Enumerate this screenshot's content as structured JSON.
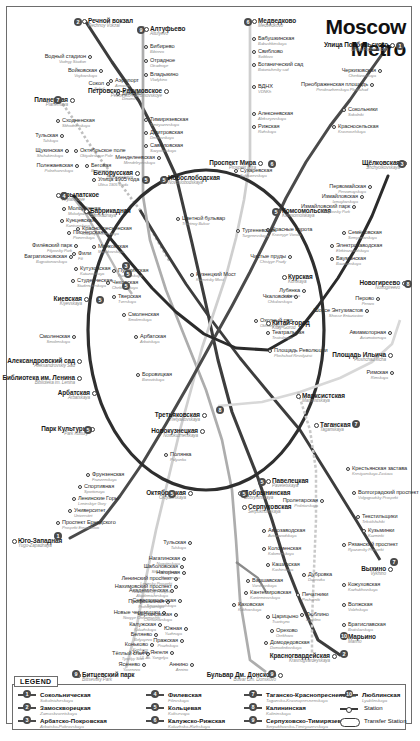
{
  "title": {
    "line1": "Moscow",
    "line2": "Metro"
  },
  "legend": {
    "heading": "LEGEND",
    "lines": [
      {
        "id": 1,
        "ru": "Сокольническая",
        "en": "Sokolnicheskaya",
        "color": "#d0021b",
        "col": 0
      },
      {
        "id": 2,
        "ru": "Замоскворецкая",
        "en": "Zamoskvoretskaya",
        "color": "#2b8a3e",
        "col": 0
      },
      {
        "id": 3,
        "ru": "Арбатско-Покровская",
        "en": "Arbatsko-Pokrovskaya",
        "color": "#1f4fa0",
        "col": 0
      },
      {
        "id": 4,
        "ru": "Филевская",
        "en": "Filevskaya",
        "color": "#4aa8dd",
        "col": 1
      },
      {
        "id": 5,
        "ru": "Кольцевая",
        "en": "Koltsevaya",
        "color": "#8a4b2a",
        "col": 1
      },
      {
        "id": 6,
        "ru": "Калужско-Рижская",
        "en": "Kaluzhsko-Rizhskaya",
        "color": "#f39200",
        "col": 1
      },
      {
        "id": 7,
        "ru": "Таганско-Краснопресненская",
        "en": "Tagansko-Krasnopresnenskaya",
        "color": "#7d3f98",
        "col": 2
      },
      {
        "id": 8,
        "ru": "Калининская",
        "en": "Kalininskaya",
        "color": "#f7d117",
        "col": 2
      },
      {
        "id": 9,
        "ru": "Серпуховско-Тимирязевская",
        "en": "Serpukhovsko-Timiryazevskaya",
        "color": "#9e9e9e",
        "col": 2
      },
      {
        "id": 10,
        "ru": "Люблинская",
        "en": "Lyublinskaya",
        "color": "#b7d44b",
        "col": 3
      }
    ],
    "symbols": [
      {
        "key": "station",
        "label": "Station"
      },
      {
        "key": "transfer",
        "label": "Transfer Station"
      }
    ]
  },
  "stations": [
    {
      "ru": "Речной вокзал",
      "en": "Rechnoy Vokzal",
      "x": 88,
      "y": 18,
      "a": "l",
      "big": true
    },
    {
      "ru": "Водный стадион",
      "en": "Vodnyy Stadion",
      "x": 86,
      "y": 54,
      "a": "r"
    },
    {
      "ru": "Войковская",
      "en": "Voykovskaya",
      "x": 97,
      "y": 68,
      "a": "r"
    },
    {
      "ru": "Сокол",
      "en": "Sokol",
      "x": 104,
      "y": 81,
      "a": "r"
    },
    {
      "ru": "Аэропорт",
      "en": "Aeroport",
      "x": 115,
      "y": 78,
      "a": "l"
    },
    {
      "ru": "Динамо",
      "en": "Dinamo",
      "x": 122,
      "y": 91,
      "a": "l"
    },
    {
      "ru": "Белорусская",
      "en": "Belorusskaya",
      "x": 133,
      "y": 170,
      "a": "r",
      "big": true
    },
    {
      "ru": "Планерная",
      "en": "Planernaya",
      "x": 68,
      "y": 97,
      "a": "r",
      "big": true
    },
    {
      "ru": "Сходненская",
      "en": "Skhodnenskaya",
      "x": 62,
      "y": 118,
      "a": "l"
    },
    {
      "ru": "Тульская",
      "en": "Tulskaya",
      "x": 58,
      "y": 133,
      "a": "r"
    },
    {
      "ru": "Щукинская",
      "en": "Shchukinskaya",
      "x": 63,
      "y": 148,
      "a": "r"
    },
    {
      "ru": "Полежаевская",
      "en": "Polezhaevskaya",
      "x": 73,
      "y": 163,
      "a": "r"
    },
    {
      "ru": "Октябрьское поле",
      "en": "Oktyabrskoye Pole",
      "x": 80,
      "y": 148,
      "a": "l"
    },
    {
      "ru": "Беговая",
      "en": "Begovaya",
      "x": 91,
      "y": 163,
      "a": "l"
    },
    {
      "ru": "Улица 1905 года",
      "en": "Ulitsa 1905 Goda",
      "x": 98,
      "y": 177,
      "a": "l"
    },
    {
      "ru": "Крылатское",
      "en": "Krylatskoye",
      "x": 62,
      "y": 192,
      "a": "l",
      "big": true
    },
    {
      "ru": "Молодёжная",
      "en": "Molodyozhnaya",
      "x": 68,
      "y": 206,
      "a": "l"
    },
    {
      "ru": "Кунцевская",
      "en": "Kuntsevskaya",
      "x": 66,
      "y": 218,
      "a": "l"
    },
    {
      "ru": "Пионерская",
      "en": "Pionerskaya",
      "x": 73,
      "y": 230,
      "a": "l"
    },
    {
      "ru": "Филёвский парк",
      "en": "Filyovsky Park",
      "x": 72,
      "y": 243,
      "a": "r"
    },
    {
      "ru": "Багратионовская",
      "en": "Bagrationovskaya",
      "x": 67,
      "y": 254,
      "a": "r"
    },
    {
      "ru": "Фили",
      "en": "Fili",
      "x": 78,
      "y": 251,
      "a": "l"
    },
    {
      "ru": "Кутузовская",
      "en": "Kutuzovskaya",
      "x": 80,
      "y": 266,
      "a": "l"
    },
    {
      "ru": "Студенческая",
      "en": "Studencheskaya",
      "x": 77,
      "y": 278,
      "a": "l"
    },
    {
      "ru": "Киевская",
      "en": "Kiyevskaya",
      "x": 82,
      "y": 296,
      "a": "r",
      "big": true
    },
    {
      "ru": "Смоленская",
      "en": "Smolenskaya",
      "x": 70,
      "y": 334,
      "a": "r"
    },
    {
      "ru": "Александровский сад",
      "en": "Aleksandrovskiy Sad",
      "x": 75,
      "y": 358,
      "a": "r",
      "big": true
    },
    {
      "ru": "Библиотека им. Ленина",
      "en": "Biblioteka im. Lenina",
      "x": 75,
      "y": 375,
      "a": "r",
      "big": true
    },
    {
      "ru": "Арбатская",
      "en": "Arbatskaya",
      "x": 90,
      "y": 390,
      "a": "r",
      "big": true
    },
    {
      "ru": "Парк Культуры",
      "en": "Park Kultury",
      "x": 88,
      "y": 426,
      "a": "r",
      "big": true
    },
    {
      "ru": "Алтуфьево",
      "en": "Altufyevo",
      "x": 150,
      "y": 26,
      "a": "l",
      "big": true
    },
    {
      "ru": "Бибирево",
      "en": "Bibirevo",
      "x": 150,
      "y": 44,
      "a": "l"
    },
    {
      "ru": "Отрадное",
      "en": "Otradnoye",
      "x": 150,
      "y": 58,
      "a": "l"
    },
    {
      "ru": "Владыкино",
      "en": "Vladykino",
      "x": 150,
      "y": 72,
      "a": "l"
    },
    {
      "ru": "Петровско-Разумовское",
      "en": "Petrovsko-Razumovskoye",
      "x": 162,
      "y": 88,
      "a": "r",
      "big": true
    },
    {
      "ru": "Тимирязевская",
      "en": "Timiryazevskaya",
      "x": 150,
      "y": 117,
      "a": "l"
    },
    {
      "ru": "Дмитровская",
      "en": "Dmitrovskaya",
      "x": 150,
      "y": 130,
      "a": "l"
    },
    {
      "ru": "Савёловская",
      "en": "Savyolovskaya",
      "x": 150,
      "y": 143,
      "a": "l"
    },
    {
      "ru": "Менделеевская",
      "en": "Mendeleyevskaya",
      "x": 155,
      "y": 155,
      "a": "r"
    },
    {
      "ru": "Новослободская",
      "en": "Novoslobodskaya",
      "x": 168,
      "y": 175,
      "a": "l",
      "big": true
    },
    {
      "ru": "Медведково",
      "en": "Medvedkovo",
      "x": 258,
      "y": 18,
      "a": "l",
      "big": true
    },
    {
      "ru": "Бабушкинская",
      "en": "Babushkinskaya",
      "x": 258,
      "y": 36,
      "a": "l"
    },
    {
      "ru": "Свиблово",
      "en": "Sviblovo",
      "x": 258,
      "y": 49,
      "a": "l"
    },
    {
      "ru": "Ботанический сад",
      "en": "Botanichesky sad",
      "x": 258,
      "y": 62,
      "a": "l"
    },
    {
      "ru": "ВДНХ",
      "en": "VDNKh",
      "x": 258,
      "y": 84,
      "a": "l"
    },
    {
      "ru": "Алексеевская",
      "en": "Alekseyevskaya",
      "x": 258,
      "y": 111,
      "a": "l"
    },
    {
      "ru": "Рижская",
      "en": "Rizhskaya",
      "x": 258,
      "y": 124,
      "a": "l"
    },
    {
      "ru": "Проспект Мира",
      "en": "Prospekt Mira",
      "x": 256,
      "y": 160,
      "a": "r",
      "big": true
    },
    {
      "ru": "Улица Подбельского",
      "en": "Ulitsa Podbelskovo",
      "x": 388,
      "y": 42,
      "a": "r",
      "big": true
    },
    {
      "ru": "Черкизовская",
      "en": "Cherkizovskaya",
      "x": 376,
      "y": 68,
      "a": "r"
    },
    {
      "ru": "Преображенская площадь",
      "en": "Preobrazhenskaya Ploshchad",
      "x": 368,
      "y": 82,
      "a": "r"
    },
    {
      "ru": "Сокольники",
      "en": "Sokolniki",
      "x": 348,
      "y": 107,
      "a": "l"
    },
    {
      "ru": "Красносельская",
      "en": "Krasnoselskaya",
      "x": 338,
      "y": 124,
      "a": "l"
    },
    {
      "ru": "Комсомольская",
      "en": "Komsomolskaya",
      "x": 282,
      "y": 208,
      "a": "l",
      "big": true
    },
    {
      "ru": "Красные ворота",
      "en": "Krasnyye Vorota",
      "x": 272,
      "y": 227,
      "a": "l"
    },
    {
      "ru": "Чистые пруды",
      "en": "Chistyye Prudy",
      "x": 286,
      "y": 254,
      "a": "r"
    },
    {
      "ru": "Лубянка",
      "en": "Lubyanka",
      "x": 300,
      "y": 288,
      "a": "r"
    },
    {
      "ru": "Охотный ряд",
      "en": "Okhotny Ryad",
      "x": 260,
      "y": 318,
      "a": "l"
    },
    {
      "ru": "Щёлковская",
      "en": "Shchyolkovskaya",
      "x": 400,
      "y": 160,
      "a": "r",
      "big": true
    },
    {
      "ru": "Первомайская",
      "en": "Pervomayskaya",
      "x": 366,
      "y": 184,
      "a": "r"
    },
    {
      "ru": "Измайловская",
      "en": "Izmaylovskaya",
      "x": 358,
      "y": 194,
      "a": "r"
    },
    {
      "ru": "Измайловский парк",
      "en": "Izmaylovsky Park",
      "x": 350,
      "y": 204,
      "a": "r"
    },
    {
      "ru": "Семёновская",
      "en": "Semyonovskaya",
      "x": 348,
      "y": 230,
      "a": "l"
    },
    {
      "ru": "Электрозаводская",
      "en": "Elektrozavodskaya",
      "x": 336,
      "y": 243,
      "a": "l"
    },
    {
      "ru": "Бауманская",
      "en": "Baumanskaya",
      "x": 336,
      "y": 256,
      "a": "l"
    },
    {
      "ru": "Курская",
      "en": "Kurskaya",
      "x": 288,
      "y": 274,
      "a": "l",
      "big": true
    },
    {
      "ru": "Чкаловская",
      "en": "Chkalovskaya",
      "x": 292,
      "y": 294,
      "a": "r"
    },
    {
      "ru": "Китай-город",
      "en": "Kitay-Gorod",
      "x": 272,
      "y": 320,
      "a": "l",
      "big": true
    },
    {
      "ru": "Новогиреево",
      "en": "Novogireevo",
      "x": 400,
      "y": 280,
      "a": "r",
      "big": true
    },
    {
      "ru": "Перово",
      "en": "Perovo",
      "x": 374,
      "y": 296,
      "a": "r"
    },
    {
      "ru": "Шоссе Энтузиастов",
      "en": "Shosse Entuziastov",
      "x": 363,
      "y": 308,
      "a": "r"
    },
    {
      "ru": "Авиамоторная",
      "en": "Aviamotornaya",
      "x": 386,
      "y": 330,
      "a": "r"
    },
    {
      "ru": "Площадь Ильича",
      "en": "Ploshchad Ilicha",
      "x": 386,
      "y": 352,
      "a": "r",
      "big": true
    },
    {
      "ru": "Римская",
      "en": "Rimskaya",
      "x": 388,
      "y": 370,
      "a": "r"
    },
    {
      "ru": "Марксистская",
      "en": "Marksistskaya",
      "x": 302,
      "y": 393,
      "a": "l",
      "big": true
    },
    {
      "ru": "Таганская",
      "en": "Taganskaya",
      "x": 320,
      "y": 422,
      "a": "l",
      "big": true
    },
    {
      "ru": "Сухаревская",
      "en": "Sukharevskaya",
      "x": 240,
      "y": 168,
      "a": "l"
    },
    {
      "ru": "Тургеневская",
      "en": "Turgenevskaya",
      "x": 242,
      "y": 228,
      "a": "l"
    },
    {
      "ru": "Цветной бульвар",
      "en": "Tsvetnoy Bulvar",
      "x": 182,
      "y": 216,
      "a": "l"
    },
    {
      "ru": "Кузнецкий Мост",
      "en": "Kuznetsky Most",
      "x": 196,
      "y": 272,
      "a": "l"
    },
    {
      "ru": "Баррикадная",
      "en": "Barrikadnaya",
      "x": 90,
      "y": 208,
      "a": "l",
      "big": true
    },
    {
      "ru": "Краснопресненская",
      "en": "Krasnopresnenskaya",
      "x": 82,
      "y": 226,
      "a": "l"
    },
    {
      "ru": "Маяковская",
      "en": "Mayakovskaya",
      "x": 98,
      "y": 244,
      "a": "l"
    },
    {
      "ru": "Пушкинская",
      "en": "Pushkinskaya",
      "x": 118,
      "y": 268,
      "a": "l"
    },
    {
      "ru": "Чеховская",
      "en": "Chekhovskaya",
      "x": 112,
      "y": 280,
      "a": "l"
    },
    {
      "ru": "Тверская",
      "en": "Tverskaya",
      "x": 118,
      "y": 294,
      "a": "l"
    },
    {
      "ru": "Смоленская",
      "en": "Smolenskaya",
      "x": 128,
      "y": 312,
      "a": "l"
    },
    {
      "ru": "Арбатская",
      "en": "Arbatskaya",
      "x": 140,
      "y": 334,
      "a": "l"
    },
    {
      "ru": "Боровицкая",
      "en": "Borovitskaya",
      "x": 142,
      "y": 372,
      "a": "l"
    },
    {
      "ru": "Театральная",
      "en": "Teatralnaya",
      "x": 272,
      "y": 330,
      "a": "l"
    },
    {
      "ru": "Площадь Революции",
      "en": "Ploshchad Revolyutsii",
      "x": 274,
      "y": 348,
      "a": "l"
    },
    {
      "ru": "Третьяковская",
      "en": "Tretyakovskaya",
      "x": 200,
      "y": 412,
      "a": "r",
      "big": true
    },
    {
      "ru": "Новокузнецкая",
      "en": "Novokuznetskaya",
      "x": 198,
      "y": 428,
      "a": "r",
      "big": true
    },
    {
      "ru": "Полянка",
      "en": "Polyanka",
      "x": 170,
      "y": 452,
      "a": "l"
    },
    {
      "ru": "Октябрьская",
      "en": "Oktyabrskaya",
      "x": 186,
      "y": 490,
      "a": "r",
      "big": true
    },
    {
      "ru": "Добрынинская",
      "en": "Dobryninskaya",
      "x": 244,
      "y": 490,
      "a": "l",
      "big": true
    },
    {
      "ru": "Серпуховская",
      "en": "Serpukhovskaya",
      "x": 248,
      "y": 504,
      "a": "l",
      "big": true
    },
    {
      "ru": "Павелецкая",
      "en": "Paveletskaya",
      "x": 272,
      "y": 478,
      "a": "l",
      "big": true
    },
    {
      "ru": "Пролетарская",
      "en": "Proletarskaya",
      "x": 318,
      "y": 498,
      "a": "r"
    },
    {
      "ru": "Автозаводская",
      "en": "Avtozavodskaya",
      "x": 268,
      "y": 528,
      "a": "l"
    },
    {
      "ru": "Коломенская",
      "en": "Kolomenskaya",
      "x": 268,
      "y": 546,
      "a": "l"
    },
    {
      "ru": "Каширская",
      "en": "Kashirskaya",
      "x": 272,
      "y": 562,
      "a": "l"
    },
    {
      "ru": "Варшавская",
      "en": "Varshavskaya",
      "x": 252,
      "y": 578,
      "a": "l"
    },
    {
      "ru": "Кантемировская",
      "en": "Kantemirovskaya",
      "x": 250,
      "y": 590,
      "a": "l"
    },
    {
      "ru": "Каховская",
      "en": "Kakhovskaya",
      "x": 238,
      "y": 602,
      "a": "l"
    },
    {
      "ru": "Царицыно",
      "en": "Tsaritsyno",
      "x": 272,
      "y": 614,
      "a": "l"
    },
    {
      "ru": "Орехово",
      "en": "Orekhovo",
      "x": 276,
      "y": 628,
      "a": "l"
    },
    {
      "ru": "Домодедовская",
      "en": "Domodedovskaya",
      "x": 270,
      "y": 640,
      "a": "l"
    },
    {
      "ru": "Красногвардейская",
      "en": "Krasnogvardeyskaya",
      "x": 330,
      "y": 653,
      "a": "r",
      "big": true
    },
    {
      "ru": "Фрунзенская",
      "en": "Frunzenskaya",
      "x": 92,
      "y": 472,
      "a": "l"
    },
    {
      "ru": "Спортивная",
      "en": "Sportivnaya",
      "x": 84,
      "y": 484,
      "a": "l"
    },
    {
      "ru": "Ленинские Горы",
      "en": "Leninskiye Gory",
      "x": 78,
      "y": 496,
      "a": "l"
    },
    {
      "ru": "Университет",
      "en": "Universitet",
      "x": 74,
      "y": 508,
      "a": "l"
    },
    {
      "ru": "Проспект Ернадского",
      "en": "Prospekt Ernadskovo",
      "x": 62,
      "y": 520,
      "a": "l"
    },
    {
      "ru": "Юго-Западная",
      "en": "Yugo-Zapadnaya",
      "x": 18,
      "y": 538,
      "a": "l",
      "big": true
    },
    {
      "ru": "Шаболовская",
      "en": "Shabolovskaya",
      "x": 178,
      "y": 564,
      "a": "r"
    },
    {
      "ru": "Ленинский проспект",
      "en": "Leninsky Prospekt",
      "x": 172,
      "y": 576,
      "a": "r"
    },
    {
      "ru": "Академическая",
      "en": "Akademicheskaya",
      "x": 168,
      "y": 588,
      "a": "r"
    },
    {
      "ru": "Профсоюзная",
      "en": "Profsoyuznaya",
      "x": 164,
      "y": 599,
      "a": "r"
    },
    {
      "ru": "Новые черемушки",
      "en": "Novyye Cheremushki",
      "x": 160,
      "y": 610,
      "a": "r"
    },
    {
      "ru": "Калужская",
      "en": "Kaluzhskaya",
      "x": 156,
      "y": 622,
      "a": "r"
    },
    {
      "ru": "Беляево",
      "en": "Belyayevo",
      "x": 152,
      "y": 632,
      "a": "r"
    },
    {
      "ru": "Коньково",
      "en": "Konkovo",
      "x": 148,
      "y": 642,
      "a": "r"
    },
    {
      "ru": "Тёплый стан",
      "en": "Tyoplyy Stan",
      "x": 144,
      "y": 651,
      "a": "r"
    },
    {
      "ru": "Ясенево",
      "en": "Yasenevo",
      "x": 140,
      "y": 662,
      "a": "r"
    },
    {
      "ru": "Битцевский парк",
      "en": "Bittsevsky Park",
      "x": 82,
      "y": 672,
      "a": "l",
      "big": true
    },
    {
      "ru": "Тульская",
      "en": "Tulskaya",
      "x": 186,
      "y": 540,
      "a": "r"
    },
    {
      "ru": "Нагатинская",
      "en": "Nagatinskaya",
      "x": 180,
      "y": 556,
      "a": "r"
    },
    {
      "ru": "Нагорная",
      "en": "Nagornaya",
      "x": 180,
      "y": 570,
      "a": "r"
    },
    {
      "ru": "Нахимовский проспект",
      "en": "Nakhimovsky Prospekt",
      "x": 172,
      "y": 584,
      "a": "r"
    },
    {
      "ru": "Севастопольская",
      "en": "Sevastopolskaya",
      "x": 176,
      "y": 598,
      "a": "r"
    },
    {
      "ru": "Чертановская",
      "en": "Chertanovskaya",
      "x": 172,
      "y": 612,
      "a": "r"
    },
    {
      "ru": "Южная",
      "en": "Yuzhnaya",
      "x": 182,
      "y": 626,
      "a": "r"
    },
    {
      "ru": "Пражская",
      "en": "Prazhskaya",
      "x": 178,
      "y": 638,
      "a": "r"
    },
    {
      "ru": "Ул. Ак. Янгеля",
      "en": "Ul. Ak. Yangelya",
      "x": 168,
      "y": 650,
      "a": "r"
    },
    {
      "ru": "Аннино",
      "en": "Annino",
      "x": 188,
      "y": 662,
      "a": "r"
    },
    {
      "ru": "Бульвар Дм. Донского",
      "en": "Bulvar Dm. Donskovo",
      "x": 276,
      "y": 672,
      "a": "r",
      "big": true
    },
    {
      "ru": "Крестьянская застава",
      "en": "Krestyanskaya Zastava",
      "x": 352,
      "y": 466,
      "a": "l"
    },
    {
      "ru": "Волгоградский проспект",
      "en": "Volgogradsky Prospekt",
      "x": 358,
      "y": 490,
      "a": "l"
    },
    {
      "ru": "Текстильщики",
      "en": "Tekstilshchiki",
      "x": 362,
      "y": 514,
      "a": "l"
    },
    {
      "ru": "Кузьминки",
      "en": "Kuzminki",
      "x": 368,
      "y": 528,
      "a": "l"
    },
    {
      "ru": "Рязанский проспект",
      "en": "Ryazansky Prospekt",
      "x": 348,
      "y": 542,
      "a": "l"
    },
    {
      "ru": "Выхино",
      "en": "Vykhino",
      "x": 386,
      "y": 566,
      "a": "r",
      "big": true
    },
    {
      "ru": "Дубровка",
      "en": "Dubrovka",
      "x": 308,
      "y": 572,
      "a": "l"
    },
    {
      "ru": "Кожуховская",
      "en": "Kozhukhovskaya",
      "x": 348,
      "y": 582,
      "a": "l"
    },
    {
      "ru": "Печатники",
      "en": "Pechatniki",
      "x": 302,
      "y": 592,
      "a": "l"
    },
    {
      "ru": "Волжская",
      "en": "Volzhskaya",
      "x": 348,
      "y": 602,
      "a": "l"
    },
    {
      "ru": "Люблино",
      "en": "Lyublino",
      "x": 306,
      "y": 612,
      "a": "l"
    },
    {
      "ru": "Братиславская",
      "en": "Bratislavskaya",
      "x": 348,
      "y": 622,
      "a": "l"
    },
    {
      "ru": "Марьино",
      "en": "Marino",
      "x": 348,
      "y": 634,
      "a": "l",
      "big": true
    }
  ]
}
